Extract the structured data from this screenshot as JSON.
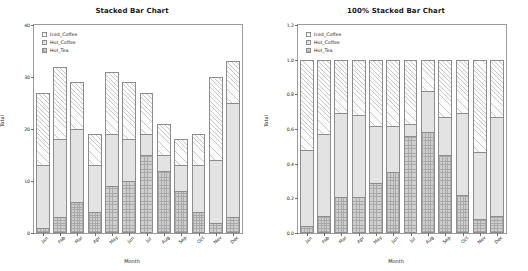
{
  "chart_data": [
    {
      "type": "bar",
      "title": "Stacked Bar Chart",
      "stacked": "absolute",
      "xlabel": "Month",
      "ylabel": "Total",
      "categories": [
        "Jan",
        "Feb",
        "Mar",
        "Apr",
        "May",
        "Jun",
        "Jul",
        "Aug",
        "Sep",
        "Oct",
        "Nov",
        "Dec"
      ],
      "ylim": [
        0,
        40
      ],
      "yticks": [
        "0",
        "10",
        "20",
        "30",
        "40"
      ],
      "ytickvalues": [
        0,
        10,
        20,
        30,
        40
      ],
      "grid": false,
      "legend_position": "upper-left",
      "series": [
        {
          "name": "Hot_Tea",
          "values": [
            1,
            3,
            6,
            4,
            9,
            10,
            15,
            12,
            8,
            4,
            2,
            3
          ]
        },
        {
          "name": "Hot_Coffee",
          "values": [
            12,
            15,
            14,
            9,
            10,
            8,
            4,
            3,
            5,
            9,
            12,
            22
          ]
        },
        {
          "name": "Iced_Coffee",
          "values": [
            14,
            14,
            9,
            6,
            12,
            11,
            8,
            6,
            5,
            6,
            16,
            8
          ]
        }
      ],
      "totals": [
        27,
        32,
        29,
        19,
        31,
        29,
        27,
        21,
        18,
        19,
        30,
        33
      ]
    },
    {
      "type": "bar",
      "title": "100% Stacked Bar Chart",
      "stacked": "percent",
      "xlabel": "Month",
      "ylabel": "Total",
      "categories": [
        "Jan",
        "Feb",
        "Mar",
        "Apr",
        "May",
        "Jun",
        "Jul",
        "Aug",
        "Sep",
        "Oct",
        "Nov",
        "Dec"
      ],
      "ylim": [
        0.0,
        1.2
      ],
      "yticks": [
        "0.0",
        "0.2",
        "0.4",
        "0.6",
        "0.8",
        "1.0",
        "1.2"
      ],
      "ytickvalues": [
        0.0,
        0.2,
        0.4,
        0.6,
        0.8,
        1.0,
        1.2
      ],
      "grid": false,
      "legend_position": "upper-left",
      "series": [
        {
          "name": "Hot_Tea",
          "values": [
            0.04,
            0.1,
            0.21,
            0.21,
            0.29,
            0.35,
            0.56,
            0.58,
            0.45,
            0.22,
            0.08,
            0.1
          ]
        },
        {
          "name": "Hot_Coffee",
          "values": [
            0.44,
            0.47,
            0.48,
            0.47,
            0.33,
            0.27,
            0.07,
            0.24,
            0.22,
            0.47,
            0.39,
            0.57
          ]
        },
        {
          "name": "Iced_Coffee",
          "values": [
            0.52,
            0.43,
            0.31,
            0.32,
            0.38,
            0.38,
            0.37,
            0.18,
            0.33,
            0.31,
            0.53,
            0.33
          ]
        }
      ]
    }
  ],
  "legend": {
    "items": [
      {
        "label": "Iced_Coffee",
        "pattern": "diagonal-hatch"
      },
      {
        "label": "Hot_Coffee",
        "pattern": "cross-hatch-light"
      },
      {
        "label": "Hot_Tea",
        "pattern": "cross-hatch-dark"
      }
    ]
  },
  "colors": {
    "iced_coffee": "#fbfbfb",
    "hot_coffee": "#e3e3e3",
    "hot_tea": "#cfcfcf",
    "outline": "#8d8d8d",
    "axis": "#9a9a9a",
    "text": "#1a1a1a",
    "background": "#ffffff"
  }
}
